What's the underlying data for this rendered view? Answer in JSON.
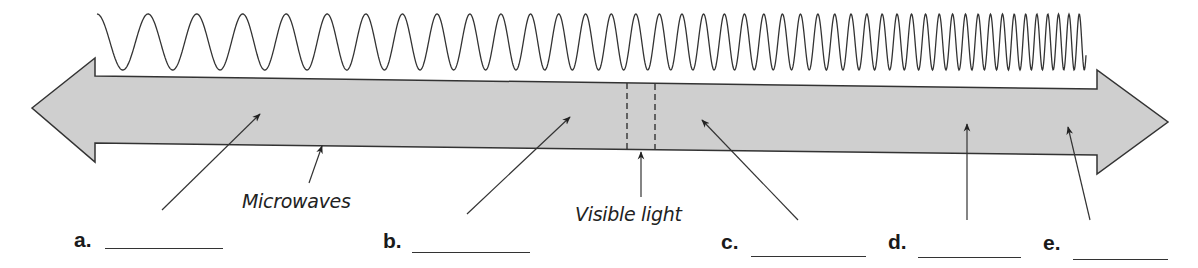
{
  "diagram": {
    "type": "labeled-spectrum-arrow",
    "colors": {
      "arrow_fill": "#cfcfcf",
      "stroke": "#333333",
      "background": "#ffffff"
    },
    "wave": {
      "description": "sine wave with increasing frequency from left to right"
    },
    "inline_labels": [
      {
        "id": "microwaves",
        "text": "Microwaves"
      },
      {
        "id": "visible",
        "text": "Visible light"
      }
    ],
    "answer_blanks": [
      {
        "letter": "a.",
        "value": ""
      },
      {
        "letter": "b.",
        "value": ""
      },
      {
        "letter": "c.",
        "value": ""
      },
      {
        "letter": "d.",
        "value": ""
      },
      {
        "letter": "e.",
        "value": ""
      }
    ]
  }
}
